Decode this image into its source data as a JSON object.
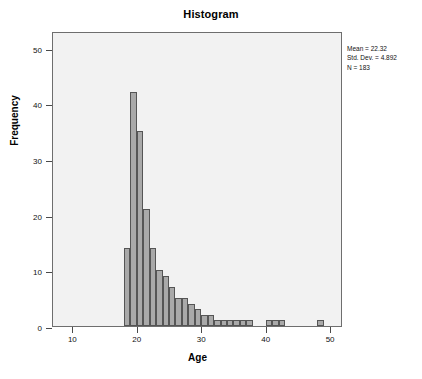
{
  "chart_data": {
    "type": "bar",
    "title": "Histogram",
    "xlabel": "Age",
    "ylabel": "Frequency",
    "xlim": [
      7,
      52
    ],
    "ylim": [
      0,
      53
    ],
    "grid": false,
    "bin_width": 1,
    "x_ticks": [
      10,
      20,
      30,
      40,
      50
    ],
    "y_ticks": [
      0,
      10,
      20,
      30,
      40,
      50
    ],
    "categories": [
      18,
      19,
      20,
      21,
      22,
      23,
      24,
      25,
      26,
      27,
      28,
      29,
      30,
      31,
      32,
      33,
      34,
      35,
      36,
      37,
      40,
      41,
      42,
      48
    ],
    "values": [
      14,
      42,
      35,
      21,
      14,
      10,
      9,
      7,
      5,
      5,
      4,
      3,
      2,
      2,
      1,
      1,
      1,
      1,
      1,
      1,
      1,
      1,
      1,
      1
    ],
    "annotations": {
      "mean_label": "Mean = 22.32",
      "stddev_label": "Std. Dev. = 4.892",
      "n_label": "N = 183"
    },
    "colors": {
      "bar_fill": "#a9a9a9",
      "bar_border": "#555555",
      "plot_background": "#f2f2f2",
      "frame": "#6e6e6e",
      "text": "#111111"
    }
  },
  "statistics": {
    "mean": "Mean = 22.32",
    "std_dev": "Std. Dev. = 4.892",
    "n": "N = 183"
  }
}
